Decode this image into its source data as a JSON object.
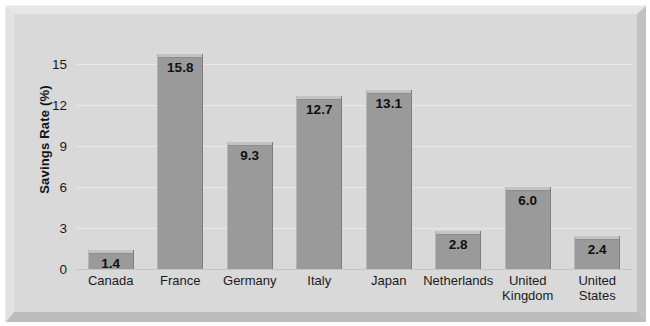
{
  "chart_data": {
    "type": "bar",
    "title": "",
    "xlabel": "",
    "ylabel": "Savings Rate (%)",
    "categories": [
      "Canada",
      "France",
      "Germany",
      "Italy",
      "Japan",
      "Netherlands",
      "United Kingdom",
      "United States"
    ],
    "values": [
      1.4,
      15.8,
      9.3,
      12.7,
      13.1,
      2.8,
      6.0,
      2.4
    ],
    "value_labels": [
      "1.4",
      "15.8",
      "9.3",
      "12.7",
      "13.1",
      "2.8",
      "6.0",
      "2.4"
    ],
    "ylim": [
      0,
      16.5
    ],
    "yticks": [
      0,
      3,
      6,
      9,
      12,
      15
    ],
    "ytick_labels": [
      "0",
      "3",
      "6",
      "9",
      "12",
      "15"
    ],
    "grid": true,
    "legend": "none",
    "colors": {
      "bar_fill": "#9a9a9a",
      "bar_cap": "#c3c3c3",
      "plot_background": "#d9d9d9",
      "gridline": "#e9e9e9",
      "axis_line": "#c4c4c4",
      "text": "#1b1b1b",
      "frame": "#d4d4d4"
    }
  }
}
